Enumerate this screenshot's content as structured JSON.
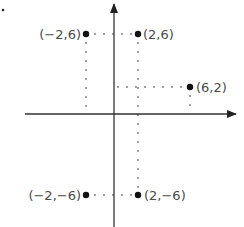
{
  "diagram": {
    "type": "coordinate-plane",
    "axes": {
      "origin_px": [
        114,
        114
      ],
      "x_axis": {
        "from_px": 25,
        "to_px": 238,
        "arrow": "right"
      },
      "y_axis": {
        "from_px": 228,
        "to_px": 2,
        "arrow": "up"
      },
      "color": "#333333"
    },
    "points": [
      {
        "label": "(−2,6)",
        "x": -2,
        "y": 6,
        "px": [
          86,
          34
        ]
      },
      {
        "label": "(2,6)",
        "x": 2,
        "y": 6,
        "px": [
          138,
          34
        ]
      },
      {
        "label": "(6,2)",
        "x": 6,
        "y": 2,
        "px": [
          190,
          87
        ]
      },
      {
        "label": "(−2,−6)",
        "x": -2,
        "y": -6,
        "px": [
          86,
          195
        ]
      },
      {
        "label": "(2,−6)",
        "x": 2,
        "y": -6,
        "px": [
          138,
          195
        ]
      }
    ],
    "stray_mark_px": [
      3,
      10
    ],
    "point_color": "#111111",
    "label_color": "#4a4a4a"
  }
}
